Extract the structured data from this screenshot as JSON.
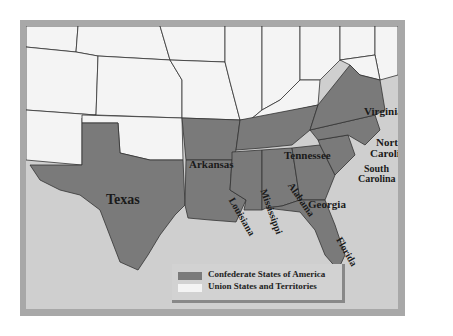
{
  "map": {
    "title": "",
    "colors": {
      "confederate": "#7a7a7a",
      "union": "#f4f4f4",
      "water": "#cfcfcf",
      "frame": "#a8a8a8",
      "border": "#333333"
    },
    "state_labels": {
      "texas": "Texas",
      "arkansas": "Arkansas",
      "louisiana": "Louisiana",
      "mississippi": "Mississippi",
      "alabama": "Alabama",
      "georgia": "Georgia",
      "florida": "Florida",
      "tennessee": "Tennessee",
      "virginia": "Virginia",
      "north_carolina_1": "North",
      "north_carolina_2": "Carolina",
      "south_carolina_1": "South",
      "south_carolina_2": "Carolina"
    }
  },
  "legend": {
    "items": [
      {
        "label": "Confederate States of America",
        "color": "#7a7a7a"
      },
      {
        "label": "Union States and Territories",
        "color": "#f4f4f4"
      }
    ]
  }
}
